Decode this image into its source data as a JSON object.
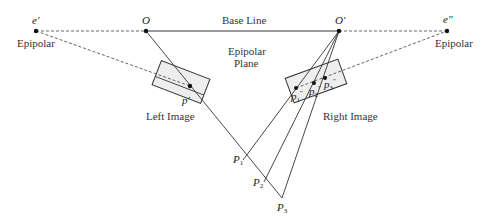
{
  "diagram": {
    "type": "epipolar-geometry",
    "colors": {
      "line": "#333333",
      "rect_fill": "#eeeeee",
      "dashed": "#555555"
    },
    "points": {
      "e_left": {
        "label": "e′",
        "x": 36,
        "y": 31
      },
      "O": {
        "label": "O",
        "x": 146,
        "y": 31
      },
      "O_prime": {
        "label": "O′",
        "x": 339,
        "y": 31
      },
      "e_right": {
        "label": "e″",
        "x": 447,
        "y": 31
      },
      "p_prime": {
        "label": "p′",
        "x": 190,
        "y": 86
      },
      "p1": {
        "label": "p",
        "sub": "1",
        "sup": "″",
        "x": 296,
        "y": 88
      },
      "p2": {
        "label": "p",
        "sub": "2",
        "sup": "″",
        "x": 314,
        "y": 83
      },
      "p3": {
        "label": "p",
        "sub": "3",
        "sup": "″",
        "x": 325,
        "y": 78
      },
      "P1": {
        "label": "P",
        "sub": "1",
        "x": 243,
        "y": 160
      },
      "P2": {
        "label": "P",
        "sub": "2",
        "x": 264,
        "y": 182
      },
      "P3": {
        "label": "P",
        "sub": "3",
        "x": 282,
        "y": 198
      }
    },
    "labels": {
      "base_line": "Base Line",
      "epipolar_plane_1": "Epipolar",
      "epipolar_plane_2": "Plane",
      "epipolar_left": "Epipolar",
      "epipolar_right": "Epipolar",
      "left_image": "Left Image",
      "right_image": "Right Image"
    }
  }
}
